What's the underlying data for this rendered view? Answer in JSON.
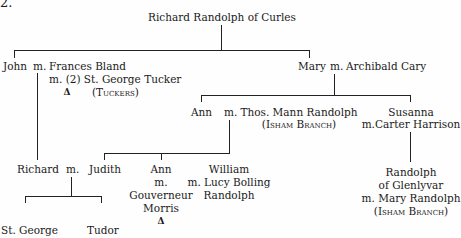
{
  "figure_number": "2.",
  "root": "Richard Randolph of Curles",
  "john": {
    "name": "John",
    "m": "m.",
    "spouse": "Frances Bland",
    "spouse_remarried": "m. (2) St. George Tucker",
    "tuckers": "(Tuckers)",
    "triangle": "Δ"
  },
  "mary": {
    "name": "Mary",
    "m": "m.",
    "spouse": "Archibald Cary"
  },
  "ann": {
    "name": "Ann",
    "m": "m."
  },
  "thos": {
    "name": "Thos. Mann Randolph",
    "branch": "(Isham Branch)"
  },
  "susanna": {
    "name": "Susanna",
    "spouse": "m.Carter Harrison"
  },
  "richard": {
    "name": "Richard",
    "m": "m."
  },
  "judith": {
    "name": "Judith"
  },
  "ann2": {
    "name": "Ann",
    "m": "m.",
    "spouse1": "Gouverneur",
    "spouse2": "Morris",
    "triangle": "Δ"
  },
  "william": {
    "name": "William",
    "spouse": "m. Lucy Bolling",
    "surname": "Randolph"
  },
  "glenlyvar": {
    "line1": "Randolph",
    "line2": "of Glenlyvar",
    "line3": "m. Mary Randolph",
    "branch": "(Isham Branch)"
  },
  "stgeorge": {
    "name": "St. George"
  },
  "tudor": {
    "name": "Tudor"
  }
}
